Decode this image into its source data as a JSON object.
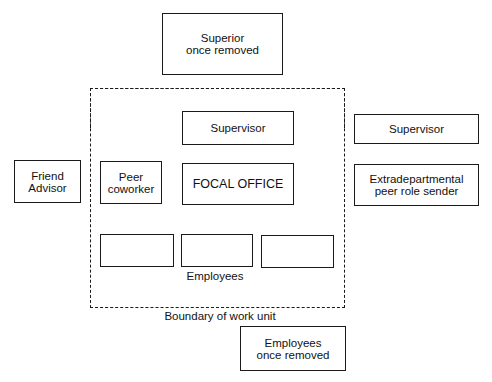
{
  "diagram": {
    "superior_once_removed": "Superior\nonce removed",
    "supervisor_inner": "Supervisor",
    "supervisor_outer": "Supervisor",
    "friend_advisor": "Friend\nAdvisor",
    "peer_coworker": "Peer\ncoworker",
    "focal_office": "FOCAL OFFICE",
    "extradepartmental": "Extradepartmental\npeer role sender",
    "employees_label": "Employees",
    "boundary_label": "Boundary of work unit",
    "employees_once_removed": "Employees\nonce removed"
  }
}
